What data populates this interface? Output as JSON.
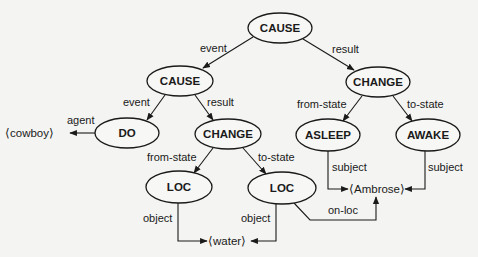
{
  "diagram": {
    "nodes": [
      {
        "id": "cause_top",
        "label": "CAUSE",
        "cx": 280,
        "cy": 28
      },
      {
        "id": "cause_left",
        "label": "CAUSE",
        "cx": 180,
        "cy": 81
      },
      {
        "id": "change_right",
        "label": "CHANGE",
        "cx": 378,
        "cy": 82
      },
      {
        "id": "do",
        "label": "DO",
        "cx": 127,
        "cy": 133
      },
      {
        "id": "change_mid",
        "label": "CHANGE",
        "cx": 228,
        "cy": 134
      },
      {
        "id": "asleep",
        "label": "ASLEEP",
        "cx": 328,
        "cy": 135
      },
      {
        "id": "awake",
        "label": "AWAKE",
        "cx": 428,
        "cy": 135
      },
      {
        "id": "loc_left",
        "label": "LOC",
        "cx": 179,
        "cy": 187
      },
      {
        "id": "loc_right",
        "label": "LOC",
        "cx": 282,
        "cy": 188
      }
    ],
    "leaves": {
      "cowboy": "⟨cowboy⟩",
      "ambrose": "⟨Ambrose⟩",
      "water": "⟨water⟩"
    },
    "edge_labels": {
      "top_event": "event",
      "top_result": "result",
      "left_event": "event",
      "left_result": "result",
      "agent": "agent",
      "mid_from_state": "from-state",
      "mid_to_state": "to-state",
      "right_from_state": "from-state",
      "right_to_state": "to-state",
      "asleep_subject": "subject",
      "awake_subject": "subject",
      "loc_left_object": "object",
      "loc_right_object": "object",
      "on_loc": "on-loc"
    }
  }
}
